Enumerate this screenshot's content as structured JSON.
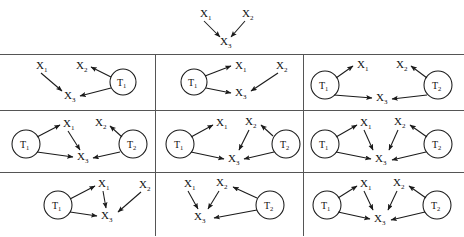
{
  "figure": {
    "title": "",
    "node_labels": {
      "x1": "X",
      "x1_sub": "1",
      "x2": "X",
      "x2_sub": "2",
      "x3": "X",
      "x3_sub": "3",
      "t1": "T",
      "t1_sub": "1",
      "t2": "T",
      "t2_sub": "2"
    },
    "colors": {
      "stroke": "#1a1a1a",
      "grid": "#555555",
      "background": "#ffffff"
    },
    "header_graph": {
      "name": "ground-truth-graph",
      "nodes": [
        "X1",
        "X2",
        "X3"
      ],
      "edges": [
        {
          "from": "X1",
          "to": "X3"
        },
        {
          "from": "X2",
          "to": "X3"
        }
      ]
    },
    "grid": {
      "rows": 3,
      "cols": 3,
      "panels": [
        {
          "id": "panel-1-1",
          "nodes": [
            "X1",
            "X2",
            "X3",
            "T1"
          ],
          "edges": [
            {
              "from": "X1",
              "to": "X3"
            },
            {
              "from": "T1",
              "to": "X2"
            },
            {
              "from": "T1",
              "to": "X3"
            }
          ]
        },
        {
          "id": "panel-1-2",
          "nodes": [
            "X1",
            "X2",
            "X3",
            "T1"
          ],
          "edges": [
            {
              "from": "T1",
              "to": "X1"
            },
            {
              "from": "T1",
              "to": "X3"
            },
            {
              "from": "X2",
              "to": "X3"
            }
          ]
        },
        {
          "id": "panel-1-3",
          "nodes": [
            "X1",
            "X2",
            "X3",
            "T1",
            "T2"
          ],
          "edges": [
            {
              "from": "T1",
              "to": "X1"
            },
            {
              "from": "T1",
              "to": "X3"
            },
            {
              "from": "T2",
              "to": "X2"
            },
            {
              "from": "T2",
              "to": "X3"
            }
          ]
        },
        {
          "id": "panel-2-1",
          "nodes": [
            "X1",
            "X2",
            "X3",
            "T1",
            "T2"
          ],
          "edges": [
            {
              "from": "T1",
              "to": "X1"
            },
            {
              "from": "T1",
              "to": "X3"
            },
            {
              "from": "X1",
              "to": "X3"
            },
            {
              "from": "T2",
              "to": "X2"
            },
            {
              "from": "T2",
              "to": "X3"
            }
          ]
        },
        {
          "id": "panel-2-2",
          "nodes": [
            "X1",
            "X2",
            "X3",
            "T1",
            "T2"
          ],
          "edges": [
            {
              "from": "T1",
              "to": "X1"
            },
            {
              "from": "T1",
              "to": "X3"
            },
            {
              "from": "T2",
              "to": "X2"
            },
            {
              "from": "X2",
              "to": "X3"
            },
            {
              "from": "T2",
              "to": "X3"
            }
          ]
        },
        {
          "id": "panel-2-3",
          "nodes": [
            "X1",
            "X2",
            "X3",
            "T1",
            "T2"
          ],
          "edges": [
            {
              "from": "T1",
              "to": "X1"
            },
            {
              "from": "T1",
              "to": "X3"
            },
            {
              "from": "X1",
              "to": "X3"
            },
            {
              "from": "T2",
              "to": "X2"
            },
            {
              "from": "X2",
              "to": "X3"
            },
            {
              "from": "T2",
              "to": "X3"
            }
          ]
        },
        {
          "id": "panel-3-1",
          "nodes": [
            "X1",
            "X2",
            "X3",
            "T1"
          ],
          "edges": [
            {
              "from": "T1",
              "to": "X1"
            },
            {
              "from": "T1",
              "to": "X3"
            },
            {
              "from": "X1",
              "to": "X3"
            },
            {
              "from": "X2",
              "to": "X3"
            }
          ]
        },
        {
          "id": "panel-3-2",
          "nodes": [
            "X1",
            "X2",
            "X3",
            "T2"
          ],
          "edges": [
            {
              "from": "X1",
              "to": "X3"
            },
            {
              "from": "X2",
              "to": "X3"
            },
            {
              "from": "T2",
              "to": "X2"
            },
            {
              "from": "T2",
              "to": "X3"
            }
          ]
        },
        {
          "id": "panel-3-3",
          "nodes": [
            "X1",
            "X2",
            "X3",
            "T1",
            "T2"
          ],
          "edges": [
            {
              "from": "T1",
              "to": "X1"
            },
            {
              "from": "T1",
              "to": "X3"
            },
            {
              "from": "X1",
              "to": "X3"
            },
            {
              "from": "T2",
              "to": "X2"
            },
            {
              "from": "X2",
              "to": "X3"
            },
            {
              "from": "T2",
              "to": "X3"
            }
          ]
        }
      ]
    }
  }
}
